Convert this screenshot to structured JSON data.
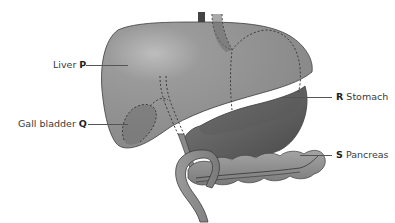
{
  "diagram": {
    "labels": [
      {
        "id": "P",
        "name": "Liver",
        "letter": "P",
        "side": "left"
      },
      {
        "id": "Q",
        "name": "Gall bladder",
        "letter": "Q",
        "side": "left"
      },
      {
        "id": "R",
        "name": "Stomach",
        "letter": "R",
        "side": "right"
      },
      {
        "id": "S",
        "name": "Pancreas",
        "letter": "S",
        "side": "right"
      }
    ],
    "colors": {
      "liver": "#8c8c8c",
      "liver_highlight": "#b4b4b4",
      "stomach": "#6e6e6e",
      "stomach_dark": "#555555",
      "gall_bladder": "#6f6f6f",
      "pancreas": "#8a8a8a",
      "duct": "#7a7a7a",
      "outline": "#3c3c3c",
      "text": "#3a3a3a"
    }
  }
}
